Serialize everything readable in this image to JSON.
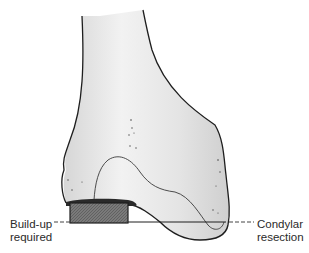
{
  "figure": {
    "labels": {
      "buildup_line1": "Build-up",
      "buildup_line2": "required",
      "resection_line1": "Condylar",
      "resection_line2": "resection"
    },
    "colors": {
      "bone_fill": "#e8e8e8",
      "bone_outline": "#1e1e1e",
      "buildup_block": "#6e6e6e",
      "label_text": "#2a2a2a",
      "background": "#ffffff"
    }
  }
}
